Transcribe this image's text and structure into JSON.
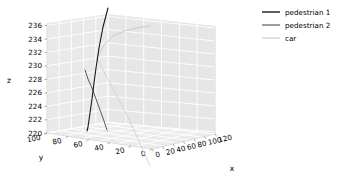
{
  "figure": {
    "background": "#ffffff",
    "pane_color": "#e8e8e8",
    "grid_color": "#ffffff"
  },
  "axes": {
    "z": {
      "label": "z",
      "ticks": [
        "236",
        "234",
        "232",
        "230",
        "228",
        "226",
        "224",
        "222",
        "220"
      ],
      "range": [
        219,
        237
      ]
    },
    "y": {
      "label": "y",
      "ticks": [
        "100",
        "80",
        "60",
        "40",
        "20",
        "0"
      ],
      "range": [
        0,
        100
      ]
    },
    "x": {
      "label": "x",
      "ticks": [
        "0",
        "20",
        "40",
        "60",
        "80",
        "100",
        "120"
      ],
      "range": [
        0,
        120
      ]
    }
  },
  "legend": {
    "entries": [
      {
        "label": "pedestrian 1",
        "color": "#1a1a1a"
      },
      {
        "label": "pedestrian 2",
        "color": "#5a5a5a"
      },
      {
        "label": "car",
        "color": "#c9c9c9"
      }
    ]
  },
  "chart_data": {
    "type": "line",
    "projection": "3d",
    "title": "",
    "xlabel": "x",
    "ylabel": "y",
    "zlabel": "z",
    "xlim": [
      0,
      120
    ],
    "ylim": [
      0,
      100
    ],
    "zlim": [
      219,
      237
    ],
    "grid": true,
    "legend_position": "upper right",
    "xticks": [
      0,
      20,
      40,
      60,
      80,
      100,
      120
    ],
    "yticks": [
      0,
      20,
      40,
      60,
      80,
      100
    ],
    "zticks": [
      220,
      222,
      224,
      226,
      228,
      230,
      232,
      234,
      236
    ],
    "series": [
      {
        "name": "pedestrian 1",
        "color": "#1a1a1a",
        "screen_path": "108,8 103,27 99,48 96,68 94,83 92,99 90,113 88,127 87,131",
        "points_xyz": [
          {
            "x": 36,
            "y": 58,
            "z": 237.0
          },
          {
            "x": 36,
            "y": 57,
            "z": 234.5
          },
          {
            "x": 36,
            "y": 56,
            "z": 231.8
          },
          {
            "x": 35,
            "y": 55,
            "z": 229.2
          },
          {
            "x": 35,
            "y": 54,
            "z": 227.3
          },
          {
            "x": 35,
            "y": 53,
            "z": 225.2
          },
          {
            "x": 34,
            "y": 52,
            "z": 223.4
          },
          {
            "x": 34,
            "y": 51,
            "z": 221.6
          },
          {
            "x": 34,
            "y": 51,
            "z": 221.1
          }
        ]
      },
      {
        "name": "pedestrian 2",
        "color": "#5a5a5a",
        "screen_path": "85,70 88,79 92,88 96,99 100,110 104,121 107,130",
        "points_xyz": [
          {
            "x": 32,
            "y": 60,
            "z": 227.0
          },
          {
            "x": 33,
            "y": 58,
            "z": 225.8
          },
          {
            "x": 35,
            "y": 56,
            "z": 224.6
          },
          {
            "x": 37,
            "y": 54,
            "z": 223.2
          },
          {
            "x": 39,
            "y": 52,
            "z": 221.7
          },
          {
            "x": 41,
            "y": 50,
            "z": 220.3
          },
          {
            "x": 43,
            "y": 49,
            "z": 219.2
          }
        ]
      },
      {
        "name": "car",
        "color": "#c9c9c9",
        "screen_path": "97,58 104,45 113,36 124,31 137,28 150,26",
        "points_xyz": [
          {
            "x": 38,
            "y": 56,
            "z": 228.5
          },
          {
            "x": 46,
            "y": 53,
            "z": 230.2
          },
          {
            "x": 56,
            "y": 50,
            "z": 231.4
          },
          {
            "x": 68,
            "y": 47,
            "z": 232.0
          },
          {
            "x": 82,
            "y": 44,
            "z": 232.4
          },
          {
            "x": 96,
            "y": 41,
            "z": 232.7
          }
        ]
      },
      {
        "name": "car-floor-projection",
        "color": "#d2d2d2",
        "screen_path": "98,60 112,87 128,117 142,148 150,166",
        "points_xyz": []
      }
    ]
  }
}
